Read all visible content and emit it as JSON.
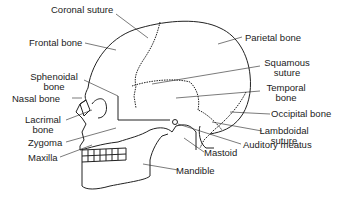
{
  "diagram": {
    "labels": {
      "coronal_suture": "Coronal suture",
      "frontal_bone": "Frontal bone",
      "parietal_bone": "Parietal bone",
      "sphenoidal_bone_1": "Sphenoidal",
      "sphenoidal_bone_2": "bone",
      "squamous_suture_1": "Squamous",
      "squamous_suture_2": "suture",
      "nasal_bone": "Nasal bone",
      "temporal_bone_1": "Temporal",
      "temporal_bone_2": "bone",
      "lacrimal_bone_1": "Lacrimal",
      "lacrimal_bone_2": "bone",
      "occipital_bone": "Occipital bone",
      "lambdoidal_suture_1": "Lambdoidal",
      "lambdoidal_suture_2": "suture",
      "zygoma": "Zygoma",
      "auditory_meatus": "Auditory meatus",
      "maxilla": "Maxilla",
      "mastoid": "Mastoid",
      "mandible": "Mandible"
    }
  }
}
